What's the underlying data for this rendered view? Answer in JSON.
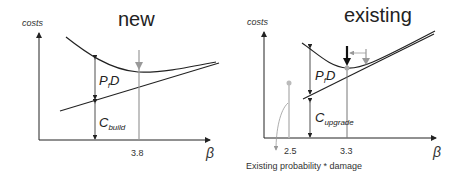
{
  "panels": [
    {
      "title": "new",
      "yaxis_label": "costs",
      "xaxis_label": "β",
      "failure_label_main": "P",
      "failure_label_sub": "f",
      "failure_label_tail": "D",
      "cost_label_main": "C",
      "cost_label_sub": "build",
      "optimum_tick": "3.8"
    },
    {
      "title": "existing",
      "yaxis_label": "costs",
      "xaxis_label": "β",
      "failure_label_main": "P",
      "failure_label_sub": "f",
      "failure_label_tail": "D",
      "cost_label_main": "C",
      "cost_label_sub": "upgrade",
      "existing_tick": "2.5",
      "optimum_tick": "3.3",
      "annotation": "Existing probability * damage"
    }
  ],
  "colors": {
    "line": "#222222",
    "gray": "#999999",
    "light_gray": "#bbbbbb"
  }
}
